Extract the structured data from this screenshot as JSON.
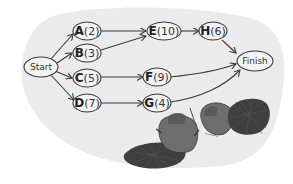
{
  "diagram": {
    "title": "",
    "start": {
      "label": "Start"
    },
    "finish": {
      "label": "Finish"
    },
    "tasks": [
      {
        "letter": "A",
        "duration": "(2)"
      },
      {
        "letter": "B",
        "duration": "(3)"
      },
      {
        "letter": "C",
        "duration": "(5)"
      },
      {
        "letter": "D",
        "duration": "(7)"
      },
      {
        "letter": "E",
        "duration": "(10)"
      },
      {
        "letter": "F",
        "duration": "(9)"
      },
      {
        "letter": "G",
        "duration": "(4)"
      },
      {
        "letter": "H",
        "duration": "(6)"
      }
    ],
    "edges": [
      [
        "Start",
        "A"
      ],
      [
        "Start",
        "B"
      ],
      [
        "Start",
        "C"
      ],
      [
        "Start",
        "D"
      ],
      [
        "A",
        "E"
      ],
      [
        "B",
        "E"
      ],
      [
        "C",
        "F"
      ],
      [
        "D",
        "G"
      ],
      [
        "E",
        "H"
      ],
      [
        "H",
        "Finish"
      ],
      [
        "F",
        "Finish"
      ],
      [
        "G",
        "Finish"
      ]
    ],
    "illustration": "two beavers with flat scaly tails",
    "colors": {
      "background_blob": "#ebebeb",
      "stroke": "#3a3a3a",
      "node_fill": "#f3f3f3",
      "beaver_body": "#6e6e6e",
      "beaver_tail": "#3f3f3f"
    }
  }
}
